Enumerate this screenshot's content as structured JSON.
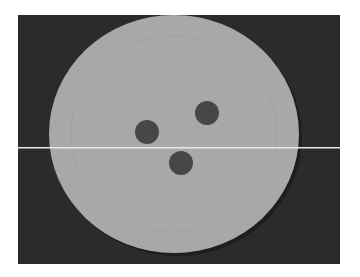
{
  "image": {
    "subject": "paper plate with three dark dots",
    "colors": {
      "page_background": "#ffffff",
      "photo_background": "#2b2b2b",
      "plate": "#a8a8a8",
      "plate_shadow": "#1e1e1e",
      "dots": "#474747",
      "scan_line": "#e8e8e8"
    },
    "plate": {
      "cx": 156,
      "cy": 119,
      "rx": 125,
      "ry": 119
    },
    "dots": [
      {
        "cx": 129,
        "cy": 117,
        "r": 12
      },
      {
        "cx": 189,
        "cy": 98,
        "r": 12
      },
      {
        "cx": 163,
        "cy": 148,
        "r": 12
      }
    ],
    "scan_line_y": 132
  }
}
